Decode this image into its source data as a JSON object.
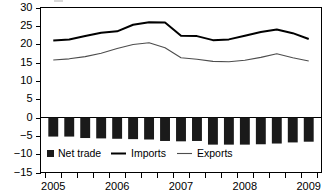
{
  "chart_data": {
    "type": "bar",
    "title": "",
    "subtitle": "",
    "xlabel": "",
    "ylabel": "",
    "ylim": [
      -15,
      30
    ],
    "grid": false,
    "legend_position": "bottom-left",
    "y_ticks": [
      30,
      25,
      20,
      15,
      10,
      5,
      0,
      -5,
      -10,
      -15
    ],
    "y_tick_labels": [
      "30",
      "25",
      "20",
      "15",
      "10",
      "5",
      "0",
      "−5",
      "−10",
      "−15"
    ],
    "x_year_labels": [
      "2005",
      "2006",
      "2007",
      "2008",
      "2009"
    ],
    "x_year_positions": [
      0,
      4,
      8,
      12,
      16
    ],
    "x": [
      "2005 Q1",
      "2005 Q2",
      "2005 Q3",
      "2005 Q4",
      "2006 Q1",
      "2006 Q2",
      "2006 Q3",
      "2006 Q4",
      "2007 Q1",
      "2007 Q2",
      "2007 Q3",
      "2007 Q4",
      "2008 Q1",
      "2008 Q2",
      "2008 Q3",
      "2008 Q4",
      "2009 Q1"
    ],
    "categories": [
      "2005 Q1",
      "2005 Q2",
      "2005 Q3",
      "2005 Q4",
      "2006 Q1",
      "2006 Q2",
      "2006 Q3",
      "2006 Q4",
      "2007 Q1",
      "2007 Q2",
      "2007 Q3",
      "2007 Q4",
      "2008 Q1",
      "2008 Q2",
      "2008 Q3",
      "2008 Q4",
      "2009 Q1"
    ],
    "series": [
      {
        "name": "Net trade",
        "type": "bar",
        "color": "#1a1a1a",
        "values": [
          -5.2,
          -5.2,
          -5.6,
          -5.7,
          -5.8,
          -5.9,
          -6.0,
          -6.4,
          -6.5,
          -6.4,
          -7.4,
          -7.4,
          -7.4,
          -7.3,
          -7.1,
          -6.8,
          -6.6
        ]
      },
      {
        "name": "Imports",
        "type": "line",
        "color": "#000000",
        "values": [
          21.0,
          21.3,
          22.2,
          23.1,
          23.5,
          25.3,
          26.0,
          25.9,
          22.3,
          22.2,
          21.1,
          21.3,
          22.3,
          23.3,
          24.0,
          23.0,
          21.4
        ]
      },
      {
        "name": "Exports",
        "type": "line",
        "color": "#4d4d4d",
        "values": [
          15.7,
          16.0,
          16.6,
          17.5,
          18.8,
          19.9,
          20.4,
          19.0,
          16.3,
          15.9,
          15.3,
          15.2,
          15.6,
          16.4,
          17.4,
          16.3,
          15.4
        ]
      }
    ],
    "legend": [
      {
        "label": "Net trade",
        "marker": "square",
        "color": "#1a1a1a"
      },
      {
        "label": "Imports",
        "marker": "line-thick",
        "color": "#000000"
      },
      {
        "label": "Exports",
        "marker": "line-thin",
        "color": "#4d4d4d"
      }
    ]
  }
}
